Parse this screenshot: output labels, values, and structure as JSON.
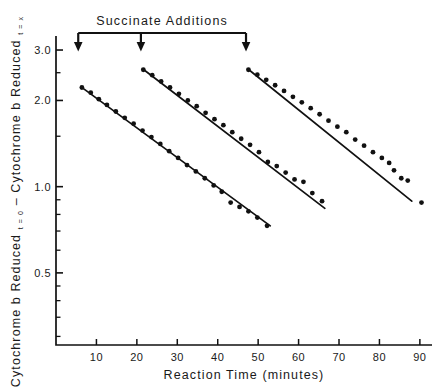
{
  "figure": {
    "annotation_label": "Succinate  Additions",
    "background": "#ffffff",
    "ink": "#111111"
  },
  "chart_data": {
    "type": "line",
    "title": "",
    "xlabel": "Reaction  Time  (minutes)",
    "ylabel_part1": "Cytochrome b Reduced",
    "ylabel_sub1": "t = 0",
    "ylabel_dash": "–",
    "ylabel_part2": "Cytochrome b Reduced",
    "ylabel_sub2": "t = x",
    "xlim": [
      0,
      93
    ],
    "ylim": [
      0.28,
      3.2
    ],
    "yscale": "log",
    "xscale": "linear",
    "grid": false,
    "legend": false,
    "xticks": [
      10,
      20,
      30,
      40,
      50,
      60,
      70,
      80,
      90
    ],
    "xticklabels": [
      "10",
      "20",
      "30",
      "40",
      "50",
      "60",
      "70",
      "80",
      "90"
    ],
    "yticks_labeled": [
      0.5,
      1.0,
      2.0,
      3.0
    ],
    "yticklabels": [
      "0.5",
      "1.0",
      "2.0",
      "3.0"
    ],
    "yticks_minor": [
      0.3,
      0.35,
      0.4,
      0.45,
      0.6,
      0.7,
      0.8,
      0.9,
      1.5,
      2.5
    ],
    "annotations": [
      {
        "name": "succinate-addition-1",
        "x": 5.5,
        "label": "arrow"
      },
      {
        "name": "succinate-addition-2",
        "x": 21.0,
        "label": "arrow"
      },
      {
        "name": "succinate-addition-3",
        "x": 47.0,
        "label": "arrow"
      }
    ],
    "series": [
      {
        "name": "decay-phase-1",
        "fit_line": {
          "x": [
            6.2,
            53.0
          ],
          "y": [
            2.23,
            0.73
          ]
        },
        "points": [
          {
            "x": 6.4,
            "y": 2.22
          },
          {
            "x": 8.6,
            "y": 2.13
          },
          {
            "x": 10.6,
            "y": 2.02
          },
          {
            "x": 12.6,
            "y": 1.93
          },
          {
            "x": 14.8,
            "y": 1.83
          },
          {
            "x": 17.0,
            "y": 1.74
          },
          {
            "x": 19.2,
            "y": 1.66
          },
          {
            "x": 21.4,
            "y": 1.57
          },
          {
            "x": 23.6,
            "y": 1.49
          },
          {
            "x": 25.8,
            "y": 1.41
          },
          {
            "x": 28.0,
            "y": 1.33
          },
          {
            "x": 30.2,
            "y": 1.26
          },
          {
            "x": 32.4,
            "y": 1.19
          },
          {
            "x": 34.6,
            "y": 1.13
          },
          {
            "x": 36.8,
            "y": 1.07
          },
          {
            "x": 39.0,
            "y": 1.01
          },
          {
            "x": 41.0,
            "y": 0.96
          },
          {
            "x": 43.2,
            "y": 0.88
          },
          {
            "x": 45.4,
            "y": 0.85
          },
          {
            "x": 47.6,
            "y": 0.82
          },
          {
            "x": 49.8,
            "y": 0.78
          },
          {
            "x": 52.2,
            "y": 0.73
          }
        ]
      },
      {
        "name": "decay-phase-2",
        "fit_line": {
          "x": [
            21.4,
            66.5
          ],
          "y": [
            2.58,
            0.84
          ]
        },
        "points": [
          {
            "x": 21.6,
            "y": 2.56
          },
          {
            "x": 23.8,
            "y": 2.45
          },
          {
            "x": 26.0,
            "y": 2.33
          },
          {
            "x": 28.2,
            "y": 2.22
          },
          {
            "x": 30.4,
            "y": 2.11
          },
          {
            "x": 32.6,
            "y": 2.0
          },
          {
            "x": 34.8,
            "y": 1.91
          },
          {
            "x": 37.0,
            "y": 1.81
          },
          {
            "x": 39.2,
            "y": 1.72
          },
          {
            "x": 41.4,
            "y": 1.64
          },
          {
            "x": 43.6,
            "y": 1.55
          },
          {
            "x": 45.8,
            "y": 1.47
          },
          {
            "x": 48.0,
            "y": 1.4
          },
          {
            "x": 50.2,
            "y": 1.32
          },
          {
            "x": 52.4,
            "y": 1.22
          },
          {
            "x": 54.6,
            "y": 1.18
          },
          {
            "x": 56.8,
            "y": 1.12
          },
          {
            "x": 59.0,
            "y": 1.06
          },
          {
            "x": 61.2,
            "y": 1.04
          },
          {
            "x": 63.4,
            "y": 0.95
          },
          {
            "x": 65.8,
            "y": 0.89
          }
        ]
      },
      {
        "name": "decay-phase-3",
        "fit_line": {
          "x": [
            47.4,
            88.0
          ],
          "y": [
            2.58,
            0.89
          ]
        },
        "points": [
          {
            "x": 47.6,
            "y": 2.56
          },
          {
            "x": 49.8,
            "y": 2.46
          },
          {
            "x": 52.0,
            "y": 2.36
          },
          {
            "x": 54.2,
            "y": 2.26
          },
          {
            "x": 56.4,
            "y": 2.16
          },
          {
            "x": 58.6,
            "y": 2.06
          },
          {
            "x": 60.8,
            "y": 1.97
          },
          {
            "x": 63.0,
            "y": 1.88
          },
          {
            "x": 65.2,
            "y": 1.79
          },
          {
            "x": 67.4,
            "y": 1.7
          },
          {
            "x": 69.6,
            "y": 1.62
          },
          {
            "x": 71.8,
            "y": 1.55
          },
          {
            "x": 74.0,
            "y": 1.46
          },
          {
            "x": 76.2,
            "y": 1.39
          },
          {
            "x": 78.4,
            "y": 1.32
          },
          {
            "x": 80.6,
            "y": 1.26
          },
          {
            "x": 82.4,
            "y": 1.21
          },
          {
            "x": 83.6,
            "y": 1.14
          },
          {
            "x": 85.4,
            "y": 1.07
          },
          {
            "x": 87.0,
            "y": 1.05
          }
        ],
        "outlier_points": [
          {
            "x": 90.4,
            "y": 0.88
          }
        ]
      }
    ]
  }
}
